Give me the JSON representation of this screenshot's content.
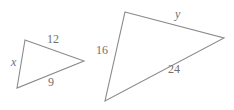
{
  "figure": {
    "type": "geometry-diagram",
    "background_color": "#ffffff",
    "stroke_color": "#8a8a8a",
    "label_color": "#6f6f6f",
    "shapes": [
      {
        "name": "small-triangle",
        "vertices": [
          [
            25,
            40
          ],
          [
            84,
            61
          ],
          [
            17,
            88
          ]
        ],
        "labels": [
          {
            "id": "small-12",
            "text": "12",
            "style": "number",
            "side": "top"
          },
          {
            "id": "small-x",
            "text": "x",
            "style": "variable",
            "side": "left"
          },
          {
            "id": "small-9",
            "text": "9",
            "style": "number",
            "side": "bottom"
          }
        ]
      },
      {
        "name": "large-triangle",
        "vertices": [
          [
            125,
            12
          ],
          [
            224,
            38
          ],
          [
            105,
            101
          ]
        ],
        "labels": [
          {
            "id": "large-y",
            "text": "y",
            "style": "variable",
            "side": "top"
          },
          {
            "id": "large-16",
            "text": "16",
            "style": "number",
            "side": "left"
          },
          {
            "id": "large-24",
            "text": "24",
            "style": "number",
            "side": "bottom"
          }
        ]
      }
    ]
  },
  "chart_data": {
    "type": "diagram",
    "title": "",
    "shapes": [
      {
        "label": "small triangle",
        "points": [
          [
            25,
            40
          ],
          [
            84,
            61
          ],
          [
            17,
            88
          ]
        ],
        "side_labels": [
          "12",
          "9",
          "x"
        ]
      },
      {
        "label": "large triangle",
        "points": [
          [
            125,
            12
          ],
          [
            224,
            38
          ],
          [
            105,
            101
          ]
        ],
        "side_labels": [
          "y",
          "24",
          "16"
        ]
      }
    ]
  }
}
